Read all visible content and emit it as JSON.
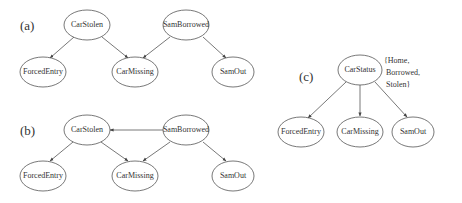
{
  "panels": {
    "a": {
      "label": "(a)",
      "nodes": {
        "car_stolen": "CarStolen",
        "sam_borrowed": "SamBorrowed",
        "forced_entry": "ForcedEntry",
        "car_missing": "CarMissing",
        "sam_out": "SamOut"
      },
      "edges": [
        [
          "CarStolen",
          "ForcedEntry"
        ],
        [
          "CarStolen",
          "CarMissing"
        ],
        [
          "SamBorrowed",
          "CarMissing"
        ],
        [
          "SamBorrowed",
          "SamOut"
        ]
      ]
    },
    "b": {
      "label": "(b)",
      "nodes": {
        "car_stolen": "CarStolen",
        "sam_borrowed": "SamBorrowed",
        "forced_entry": "ForcedEntry",
        "car_missing": "CarMissing",
        "sam_out": "SamOut"
      },
      "edges": [
        [
          "SamBorrowed",
          "CarStolen"
        ],
        [
          "CarStolen",
          "ForcedEntry"
        ],
        [
          "CarStolen",
          "CarMissing"
        ],
        [
          "SamBorrowed",
          "CarMissing"
        ],
        [
          "SamBorrowed",
          "SamOut"
        ]
      ]
    },
    "c": {
      "label": "(c)",
      "nodes": {
        "car_status": "CarStatus",
        "forced_entry": "ForcedEntry",
        "car_missing": "CarMissing",
        "sam_out": "SamOut"
      },
      "states": [
        "{Home,",
        "Borrowed,",
        "Stolen}"
      ],
      "edges": [
        [
          "CarStatus",
          "ForcedEntry"
        ],
        [
          "CarStatus",
          "CarMissing"
        ],
        [
          "CarStatus",
          "SamOut"
        ]
      ]
    }
  }
}
